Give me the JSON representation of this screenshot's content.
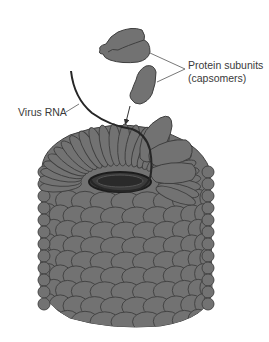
{
  "figure": {
    "labels": {
      "protein_subunits_line1": "Protein subunits",
      "protein_subunits_line2": "(capsomers)",
      "virus_rna": "Virus RNA"
    },
    "colors": {
      "capsomer_fill": "#727272",
      "capsomer_stroke": "#3f3f3f",
      "rna_stroke": "#262626",
      "label_text": "#3a3a3a",
      "leader_line": "#555555",
      "background": "#ffffff"
    }
  }
}
